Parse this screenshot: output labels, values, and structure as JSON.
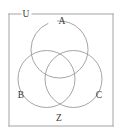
{
  "figure": {
    "kind": "venn-diagram",
    "width": 122,
    "height": 135,
    "background_color": "#ffffff",
    "stroke_color": "#9a9a9a",
    "text_color": "#3a3a3a",
    "stroke_width": 0.9
  },
  "universe": {
    "label": "U",
    "label_x": 26,
    "label_y": 14.5,
    "rect": {
      "x": 9,
      "y": 14,
      "width": 104,
      "height": 112
    },
    "gap": {
      "x": 21,
      "width": 11
    }
  },
  "sets": [
    {
      "id": "A",
      "label": "A",
      "cx": 59.5,
      "cy": 49.5,
      "r": 28.5,
      "label_x": 62,
      "label_y": 22
    },
    {
      "id": "B",
      "label": "B",
      "cx": 46.5,
      "cy": 79,
      "r": 28.5,
      "label_x": 21,
      "label_y": 96
    },
    {
      "id": "C",
      "label": "C",
      "cx": 73.5,
      "cy": 79,
      "r": 28.5,
      "label_x": 99,
      "label_y": 96
    }
  ],
  "region": {
    "label": "Z",
    "label_x": 59,
    "label_y": 119
  },
  "chart_data": {
    "type": "diagram",
    "diagram_type": "venn",
    "set_count": 3,
    "title": "",
    "labels": [
      "U",
      "A",
      "B",
      "C",
      "Z"
    ],
    "set_labels": [
      "A",
      "B",
      "C"
    ],
    "universal_set_label": "U",
    "annotation_labels": [
      "Z"
    ]
  }
}
